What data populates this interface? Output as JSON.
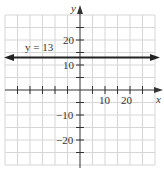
{
  "diagram": {
    "type": "coordinate-plane",
    "x_axis_label": "x",
    "y_axis_label": "y",
    "x_tick_labels": [
      {
        "value": 10,
        "text": "10"
      },
      {
        "value": 20,
        "text": "20"
      }
    ],
    "y_tick_labels": [
      {
        "value": 20,
        "text": "20"
      },
      {
        "value": 10,
        "text": "10"
      },
      {
        "value": -10,
        "text": "−10"
      },
      {
        "value": -20,
        "text": "−20"
      }
    ],
    "grid_step": 5,
    "x_range": [
      -30,
      30
    ],
    "y_range": [
      -30,
      30
    ],
    "line": {
      "equation": "y = 13",
      "y": 13,
      "label": "y = 13"
    },
    "colors": {
      "grid": "#d4d4d4",
      "axis": "#333333",
      "line": "#222222"
    }
  }
}
